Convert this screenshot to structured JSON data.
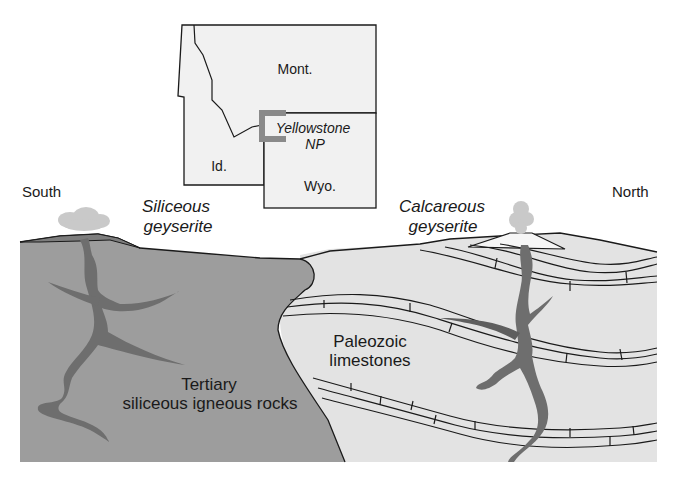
{
  "diagram": {
    "directions": {
      "left": "South",
      "right": "North"
    },
    "inset_map": {
      "labels": {
        "montana": "Mont.",
        "idaho": "Id.",
        "wyoming": "Wyo.",
        "park_line1": "Yellowstone",
        "park_line2": "NP"
      }
    },
    "deposits": {
      "siliceous_line1": "Siliceous",
      "siliceous_line2": "geyserite",
      "calcareous_line1": "Calcareous",
      "calcareous_line2": "geyserite"
    },
    "rock_units": {
      "tertiary_line1": "Tertiary",
      "tertiary_line2": "siliceous igneous rocks",
      "paleozoic_line1": "Paleozoic",
      "paleozoic_line2": "limestones"
    },
    "colors": {
      "igneous": "#9d9d9d",
      "limestone": "#e3e3e3",
      "conduit": "#6e6e6e",
      "steam": "#c9c9c9",
      "outline": "#1a1a1a",
      "park_marker": "#8a8a8a"
    }
  }
}
